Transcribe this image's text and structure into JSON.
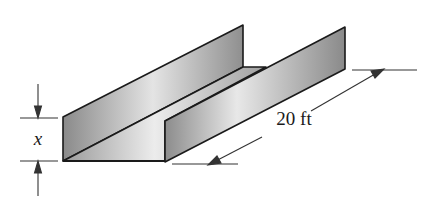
{
  "diagram": {
    "labels": {
      "height": "x",
      "length": "20 ft"
    },
    "colors": {
      "stroke": "#1a1a1a",
      "face_dark": "#8c8c8c",
      "face_light": "#e6e6e6",
      "background": "#ffffff"
    }
  }
}
